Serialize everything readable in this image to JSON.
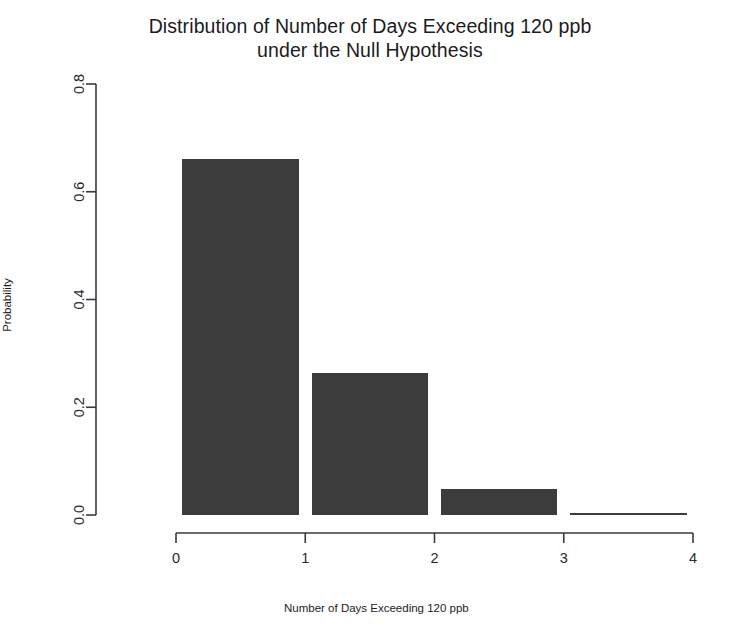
{
  "chart_data": {
    "type": "bar",
    "title": "Distribution of Number of Days Exceeding 120 ppb under the Null Hypothesis",
    "title_line1": "Distribution of Number of Days Exceeding 120 ppb",
    "title_line2": "under the Null Hypothesis",
    "xlabel": "Number of Days Exceeding 120 ppb",
    "ylabel": "Probability",
    "categories": [
      "0",
      "1",
      "2",
      "3"
    ],
    "values": [
      0.66,
      0.264,
      0.048,
      0.002
    ],
    "x": [
      0,
      1,
      2,
      3
    ],
    "xlim": [
      0,
      4
    ],
    "ylim": [
      0.0,
      0.8
    ],
    "x_ticks": [
      "0",
      "1",
      "2",
      "3",
      "4"
    ],
    "x_tick_values": [
      0,
      1,
      2,
      3,
      4
    ],
    "y_ticks": [
      "0.0",
      "0.2",
      "0.4",
      "0.6",
      "0.8"
    ],
    "y_tick_values": [
      0.0,
      0.2,
      0.4,
      0.6,
      0.8
    ],
    "grid": false,
    "legend": null,
    "bar_color": "#3c3c3c",
    "axis_color": "#3a3a3a",
    "background": "#ffffff",
    "bar_width": 0.9,
    "series": [
      {
        "name": "Null distribution",
        "values": [
          0.66,
          0.264,
          0.048,
          0.002
        ]
      }
    ]
  },
  "axis": {
    "y_tick_labels": [
      "0.0",
      "0.2",
      "0.4",
      "0.6",
      "0.8"
    ],
    "x_tick_labels": [
      "0",
      "1",
      "2",
      "3",
      "4"
    ]
  }
}
